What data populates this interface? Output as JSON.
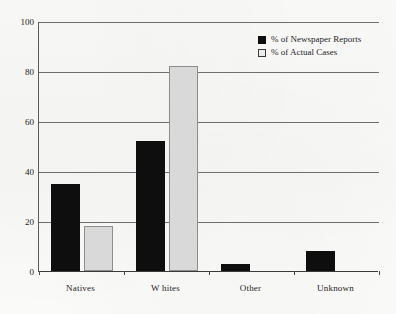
{
  "chart_data": {
    "type": "bar",
    "title": "",
    "subtitle": "",
    "xlabel": "",
    "ylabel": "",
    "ylim": [
      0,
      100
    ],
    "yticks": [
      0,
      20,
      40,
      60,
      80,
      100
    ],
    "ytick_labels": [
      "0",
      "20",
      "40",
      "60",
      "80",
      "100"
    ],
    "grid": true,
    "legend_position": "top-right",
    "categories": [
      "Natives",
      "W hites",
      "Other",
      "Unknown"
    ],
    "series": [
      {
        "name": "% of Newspaper Reports",
        "color": "#0e0e0e",
        "swatch": "filled-square",
        "values": [
          35,
          52,
          3,
          8
        ]
      },
      {
        "name": "% of Actual Cases",
        "color": "#d9d9d9",
        "swatch": "open-square",
        "values": [
          18,
          82,
          0,
          0
        ]
      }
    ]
  },
  "axes": {
    "y_axis_max_label": "100",
    "y_axis_min_label": "0"
  }
}
